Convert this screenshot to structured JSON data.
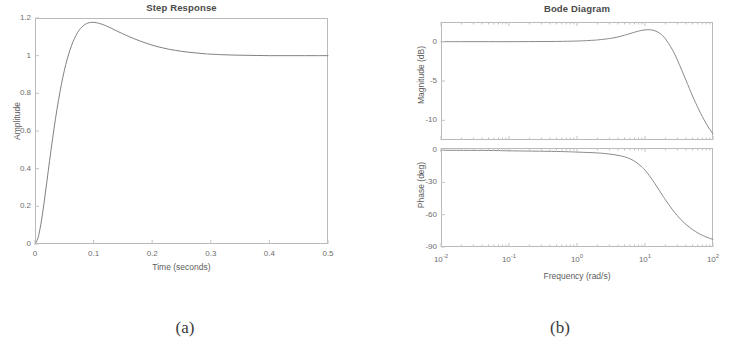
{
  "figure": {
    "caption_a": "(a)",
    "caption_b": "(b)"
  },
  "chart_data": [
    {
      "id": "step-response",
      "type": "line",
      "title": "Step Response",
      "xlabel": "Time (seconds)",
      "ylabel": "Amplitude",
      "xlim": [
        0,
        0.5
      ],
      "ylim": [
        0,
        1.2
      ],
      "xticks": [
        "0",
        "0.1",
        "0.2",
        "0.3",
        "0.4",
        "0.5"
      ],
      "xtick_values": [
        0,
        0.1,
        0.2,
        0.3,
        0.4,
        0.5
      ],
      "yticks": [
        "0",
        "0.2",
        "0.4",
        "0.6",
        "0.8",
        "1",
        "1.2"
      ],
      "ytick_values": [
        0,
        0.2,
        0.4,
        0.6,
        0.8,
        1.0,
        1.2
      ],
      "grid": false,
      "legend": null,
      "line_color": "#808080",
      "series": [
        {
          "name": "step response",
          "x": [
            0.0,
            0.005,
            0.01,
            0.015,
            0.02,
            0.025,
            0.03,
            0.035,
            0.04,
            0.045,
            0.05,
            0.055,
            0.06,
            0.065,
            0.07,
            0.075,
            0.08,
            0.085,
            0.09,
            0.095,
            0.1,
            0.105,
            0.11,
            0.115,
            0.12,
            0.125,
            0.13,
            0.135,
            0.14,
            0.145,
            0.15,
            0.16,
            0.17,
            0.18,
            0.19,
            0.2,
            0.21,
            0.22,
            0.23,
            0.24,
            0.25,
            0.26,
            0.27,
            0.28,
            0.29,
            0.3,
            0.32,
            0.34,
            0.36,
            0.38,
            0.4,
            0.42,
            0.44,
            0.46,
            0.48,
            0.5
          ],
          "y": [
            0.0,
            0.031,
            0.105,
            0.208,
            0.325,
            0.444,
            0.559,
            0.666,
            0.762,
            0.847,
            0.92,
            0.982,
            1.033,
            1.075,
            1.108,
            1.134,
            1.152,
            1.165,
            1.173,
            1.177,
            1.177,
            1.175,
            1.171,
            1.166,
            1.16,
            1.153,
            1.146,
            1.138,
            1.131,
            1.123,
            1.116,
            1.102,
            1.089,
            1.077,
            1.066,
            1.056,
            1.047,
            1.04,
            1.033,
            1.028,
            1.023,
            1.019,
            1.016,
            1.013,
            1.01,
            1.008,
            1.005,
            1.003,
            1.002,
            1.001,
            1.0,
            1.0,
            1.0,
            1.0,
            1.0,
            1.0
          ]
        }
      ]
    },
    {
      "id": "bode-magnitude",
      "type": "line",
      "title": "Bode Diagram",
      "xlabel": "Frequency  (rad/s)",
      "ylabel": "Magnitude (dB)",
      "xscale": "log",
      "xlim": [
        0.01,
        100
      ],
      "ylim": [
        -12.5,
        2.5
      ],
      "xticks": [
        "10-2",
        "10-1",
        "100",
        "101",
        "102"
      ],
      "xtick_values": [
        0.01,
        0.1,
        1,
        10,
        100
      ],
      "xtick_base": "10",
      "xtick_exponents": [
        "-2",
        "-1",
        "0",
        "1",
        "2"
      ],
      "yticks": [
        "0",
        "-5",
        "-10"
      ],
      "ytick_values": [
        0,
        -5,
        -10
      ],
      "grid": false,
      "line_color": "#8a8a8a",
      "series": [
        {
          "name": "magnitude",
          "x": [
            0.01,
            0.02,
            0.05,
            0.1,
            0.2,
            0.5,
            1.0,
            1.5,
            2.0,
            3.0,
            4.0,
            5.0,
            6.0,
            7.0,
            8.0,
            9.0,
            10.0,
            11.0,
            12.0,
            13.0,
            14.0,
            15.0,
            17.0,
            20.0,
            25.0,
            30.0,
            40.0,
            50.0,
            60.0,
            70.0,
            85.0,
            100.0
          ],
          "y": [
            0.0,
            0.0,
            0.0,
            0.0,
            0.01,
            0.03,
            0.08,
            0.15,
            0.22,
            0.4,
            0.6,
            0.82,
            1.02,
            1.2,
            1.34,
            1.44,
            1.5,
            1.52,
            1.51,
            1.46,
            1.38,
            1.27,
            0.98,
            0.35,
            -0.95,
            -2.35,
            -4.9,
            -6.9,
            -8.4,
            -9.55,
            -10.85,
            -11.7
          ]
        }
      ]
    },
    {
      "id": "bode-phase",
      "type": "line",
      "title": "",
      "xlabel": "Frequency  (rad/s)",
      "ylabel": "Phase (deg)",
      "xscale": "log",
      "xlim": [
        0.01,
        100
      ],
      "ylim": [
        -90,
        2
      ],
      "xticks": [
        "10-2",
        "10-1",
        "100",
        "101",
        "102"
      ],
      "xtick_values": [
        0.01,
        0.1,
        1,
        10,
        100
      ],
      "yticks": [
        "0",
        "-30",
        "-60",
        "-90"
      ],
      "ytick_values": [
        0,
        -30,
        -60,
        -90
      ],
      "grid": false,
      "line_color": "#8a8a8a",
      "series": [
        {
          "name": "phase",
          "x": [
            0.01,
            0.05,
            0.1,
            0.5,
            1.0,
            2.0,
            3.0,
            4.0,
            5.0,
            6.0,
            7.0,
            8.0,
            9.0,
            10.0,
            12.0,
            14.0,
            16.0,
            18.0,
            20.0,
            25.0,
            30.0,
            35.0,
            40.0,
            50.0,
            60.0,
            70.0,
            85.0,
            100.0
          ],
          "y": [
            -0.1,
            -0.3,
            -0.6,
            -1.2,
            -1.8,
            -2.6,
            -3.6,
            -4.8,
            -6.2,
            -8.0,
            -10.2,
            -12.8,
            -15.6,
            -18.6,
            -25.0,
            -31.2,
            -36.8,
            -41.8,
            -46.2,
            -54.8,
            -61.0,
            -65.6,
            -69.0,
            -73.8,
            -77.0,
            -79.2,
            -81.4,
            -83.0
          ]
        }
      ]
    }
  ]
}
